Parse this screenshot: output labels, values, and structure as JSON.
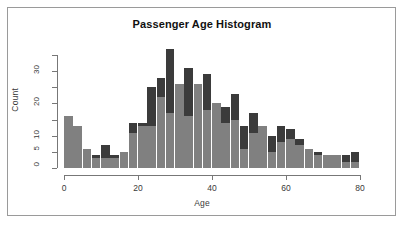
{
  "chart_data": {
    "type": "bar",
    "title": "Passenger Age Histogram",
    "xlabel": "Age",
    "ylabel": "Count",
    "xlim": [
      0,
      80
    ],
    "ylim": [
      0,
      35
    ],
    "grid": false,
    "legend": null,
    "bin_width": 2.5,
    "x_ticks": [
      0,
      20,
      40,
      60,
      80
    ],
    "x_tick_labels": [
      "0",
      "20",
      "40",
      "60",
      "80"
    ],
    "y_ticks": [
      0,
      5,
      10,
      15,
      20,
      25,
      30,
      35
    ],
    "y_tick_labels": [
      "0",
      "5",
      "10",
      "",
      "20",
      "",
      "30",
      ""
    ],
    "y_labeled_ticks": [
      0,
      5,
      10,
      20,
      30
    ],
    "colors": {
      "series_back": "#3b3b3b",
      "series_front": "#808080",
      "axis": "#777777",
      "frame": "#9a9a9a",
      "background": "#ffffff",
      "text": "#3a3a3a",
      "title_text": "#111111"
    },
    "bin_starts": [
      0,
      2.5,
      5,
      7.5,
      10,
      12.5,
      15,
      17.5,
      20,
      22.5,
      25,
      27.5,
      30,
      32.5,
      35,
      37.5,
      40,
      42.5,
      45,
      47.5,
      50,
      52.5,
      55,
      57.5,
      60,
      62.5,
      65,
      67.5,
      70,
      72.5,
      75,
      77.5
    ],
    "series": [
      {
        "name": "total",
        "values": [
          16,
          13,
          6,
          4,
          7,
          4,
          5,
          14,
          25,
          28,
          37,
          26,
          31,
          26,
          29,
          20,
          19,
          23,
          13,
          17,
          13,
          10,
          13,
          12,
          9,
          6,
          5,
          4,
          4,
          4,
          5,
          4,
          4,
          3,
          3,
          0,
          3
        ]
      },
      {
        "name": "subset",
        "values": [
          16,
          13,
          6,
          3,
          3,
          3,
          5,
          11,
          13,
          22,
          17,
          26,
          16,
          26,
          18,
          20,
          14,
          15,
          6,
          11,
          13,
          5,
          8,
          9,
          7,
          6,
          5,
          4,
          4,
          4,
          2,
          2,
          4,
          3,
          3,
          0,
          3
        ]
      }
    ],
    "bars": [
      {
        "x": 0.0,
        "back": 16,
        "front": 16
      },
      {
        "x": 2.5,
        "back": 13,
        "front": 13
      },
      {
        "x": 5.0,
        "back": 6,
        "front": 6
      },
      {
        "x": 7.5,
        "back": 4,
        "front": 3
      },
      {
        "x": 10.0,
        "back": 7,
        "front": 3
      },
      {
        "x": 12.5,
        "back": 4,
        "front": 3
      },
      {
        "x": 15.0,
        "back": 5,
        "front": 5
      },
      {
        "x": 17.5,
        "back": 14,
        "front": 11
      },
      {
        "x": 20.0,
        "back": 14,
        "front": 13
      },
      {
        "x": 22.5,
        "back": 25,
        "front": 13
      },
      {
        "x": 25.0,
        "back": 28,
        "front": 22
      },
      {
        "x": 27.5,
        "back": 37,
        "front": 17
      },
      {
        "x": 30.0,
        "back": 26,
        "front": 26
      },
      {
        "x": 32.5,
        "back": 31,
        "front": 16
      },
      {
        "x": 35.0,
        "back": 26,
        "front": 26
      },
      {
        "x": 37.5,
        "back": 29,
        "front": 18
      },
      {
        "x": 40.0,
        "back": 20,
        "front": 20
      },
      {
        "x": 42.5,
        "back": 19,
        "front": 14
      },
      {
        "x": 45.0,
        "back": 23,
        "front": 15
      },
      {
        "x": 47.5,
        "back": 13,
        "front": 6
      },
      {
        "x": 50.0,
        "back": 17,
        "front": 11
      },
      {
        "x": 52.5,
        "back": 13,
        "front": 13
      },
      {
        "x": 55.0,
        "back": 10,
        "front": 5
      },
      {
        "x": 57.5,
        "back": 13,
        "front": 8
      },
      {
        "x": 60.0,
        "back": 12,
        "front": 9
      },
      {
        "x": 62.5,
        "back": 9,
        "front": 7
      },
      {
        "x": 65.0,
        "back": 6,
        "front": 6
      },
      {
        "x": 67.5,
        "back": 5,
        "front": 4
      },
      {
        "x": 70.0,
        "back": 4,
        "front": 4
      },
      {
        "x": 72.5,
        "back": 4,
        "front": 4
      },
      {
        "x": 75.0,
        "back": 4,
        "front": 2
      },
      {
        "x": 77.5,
        "back": 5,
        "front": 2
      },
      {
        "x": 80.0,
        "back": 4,
        "front": 4
      },
      {
        "x": 82.5,
        "back": 3,
        "front": 3
      },
      {
        "x": 85.0,
        "back": 3,
        "front": 3
      },
      {
        "x": 87.5,
        "back": 0,
        "front": 0
      },
      {
        "x": 90.0,
        "back": 3,
        "front": 3
      }
    ]
  },
  "chart": {
    "title": "Passenger Age Histogram",
    "xlabel": "Age",
    "ylabel": "Count"
  }
}
